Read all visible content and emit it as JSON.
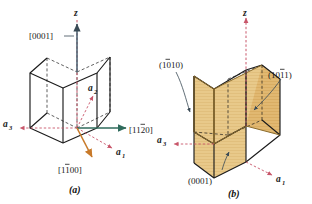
{
  "figure": {
    "type": "crystallography-diagram",
    "background_color": "#ffffff",
    "colors": {
      "edge_solid": "#1b1b1b",
      "edge_hidden": "#1b1b1b",
      "axis_z": "#c8566a",
      "axis_a": "#c8566a",
      "direction_green": "#2f6b5c",
      "direction_orange": "#c87a2a",
      "plane_fill": "#e8c98a",
      "plane_fill_dark": "#d9a84f",
      "leader_line": "#3a4a55",
      "text": "#1b1b1b"
    }
  },
  "panel_a": {
    "caption": "(a)",
    "axes": [
      {
        "name": "z-axis-label",
        "text": "z",
        "sub": ""
      },
      {
        "name": "a1-axis-label",
        "text": "a",
        "sub": "1"
      },
      {
        "name": "a2-axis-label",
        "text": "a",
        "sub": "2"
      },
      {
        "name": "a3-axis-label",
        "text": "a",
        "sub": "3"
      }
    ],
    "direction_labels": [
      {
        "name": "direction-0001",
        "text": "[0001]",
        "color": "#1b1b1b"
      },
      {
        "name": "direction-1120",
        "text": "[1120]",
        "overbar_index": 2,
        "color": "#1b1b1b"
      },
      {
        "name": "direction-1100",
        "text": "[1100]",
        "overbar_index": 1,
        "color": "#1b1b1b"
      }
    ]
  },
  "panel_b": {
    "caption": "(b)",
    "axes": [
      {
        "name": "z-axis-label",
        "text": "z",
        "sub": ""
      },
      {
        "name": "a1-axis-label",
        "text": "a",
        "sub": "1"
      },
      {
        "name": "a3-axis-label",
        "text": "a",
        "sub": "3"
      }
    ],
    "plane_labels": [
      {
        "name": "plane-1010",
        "text": "(1010)",
        "overbar_index": 0
      },
      {
        "name": "plane-1011",
        "text": "(1011)",
        "overbar_index": 2
      },
      {
        "name": "plane-0001",
        "text": "(0001)",
        "overbar_index": -1
      }
    ]
  }
}
